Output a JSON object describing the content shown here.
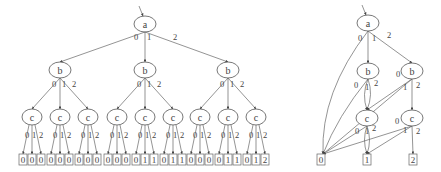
{
  "left_tree": {
    "root": {
      "label": "a",
      "edges": [
        "0",
        "1",
        "2"
      ]
    },
    "level_b": [
      {
        "label": "b",
        "edges": [
          "0",
          "1",
          "2"
        ]
      },
      {
        "label": "b",
        "edges": [
          "0",
          "1",
          "2"
        ]
      },
      {
        "label": "b",
        "edges": [
          "0",
          "1",
          "2"
        ]
      }
    ],
    "level_c_label": "c",
    "level_c_edges": [
      "0",
      "1",
      "2"
    ],
    "leaves": [
      "0",
      "0",
      "0",
      "0",
      "0",
      "0",
      "0",
      "0",
      "0",
      "0",
      "0",
      "0",
      "0",
      "1",
      "1",
      "0",
      "1",
      "1",
      "0",
      "0",
      "0",
      "0",
      "1",
      "1",
      "0",
      "1",
      "2"
    ]
  },
  "right_dd": {
    "nodes": [
      {
        "id": "a",
        "label": "a"
      },
      {
        "id": "b1",
        "label": "b"
      },
      {
        "id": "b2",
        "label": "b"
      },
      {
        "id": "c1",
        "label": "c"
      },
      {
        "id": "c2",
        "label": "c"
      }
    ],
    "terminals": [
      {
        "id": "t0",
        "label": "0"
      },
      {
        "id": "t1",
        "label": "1"
      },
      {
        "id": "t2",
        "label": "2"
      }
    ],
    "edges": [
      {
        "from": "a",
        "to": "t0",
        "label": "0"
      },
      {
        "from": "a",
        "to": "b1",
        "label": "1"
      },
      {
        "from": "a",
        "to": "b2",
        "label": "2"
      },
      {
        "from": "b1",
        "to": "t0",
        "label": "0"
      },
      {
        "from": "b1",
        "to": "c1",
        "label": "1"
      },
      {
        "from": "b1",
        "to": "c1",
        "label": "2"
      },
      {
        "from": "b2",
        "to": "t0",
        "label": "0"
      },
      {
        "from": "b2",
        "to": "c1",
        "label": "1"
      },
      {
        "from": "b2",
        "to": "c2",
        "label": "2"
      },
      {
        "from": "c1",
        "to": "t0",
        "label": "0"
      },
      {
        "from": "c1",
        "to": "t1",
        "label": "1"
      },
      {
        "from": "c1",
        "to": "t1",
        "label": "2"
      },
      {
        "from": "c2",
        "to": "t0",
        "label": "0"
      },
      {
        "from": "c2",
        "to": "t1",
        "label": "1"
      },
      {
        "from": "c2",
        "to": "t2",
        "label": "2"
      }
    ]
  }
}
